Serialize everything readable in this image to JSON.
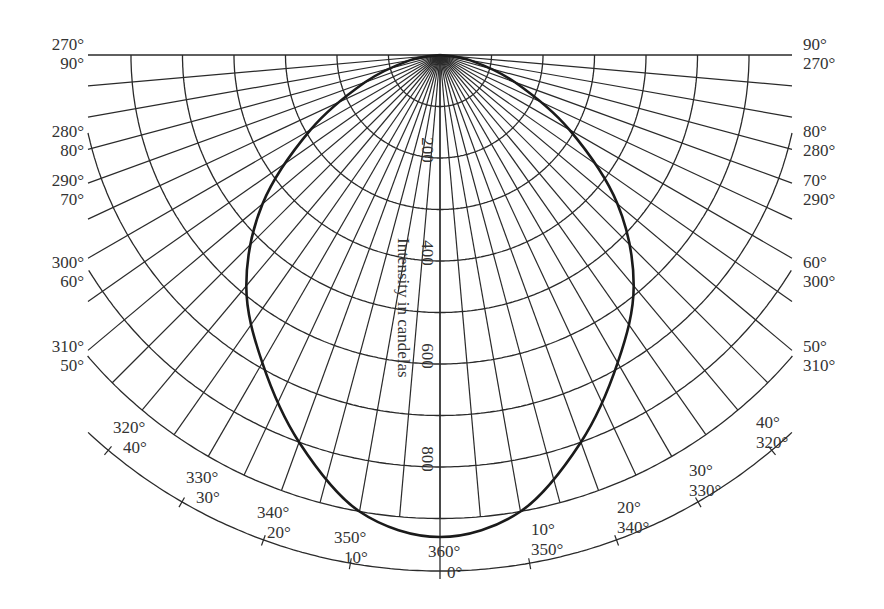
{
  "chart_data": {
    "type": "polar",
    "title": "",
    "radial_axis_label": "Intensity in candelas",
    "radial_ticks": [
      200,
      400,
      600,
      800
    ],
    "radial_grid_step": 100,
    "radial_max": 900,
    "angular_grid_step_deg": 5,
    "left_labels": [
      {
        "outer": "270°",
        "inner": "90°"
      },
      {
        "outer": "280°",
        "inner": "80°"
      },
      {
        "outer": "290°",
        "inner": "70°"
      },
      {
        "outer": "300°",
        "inner": "60°"
      },
      {
        "outer": "310°",
        "inner": "50°"
      },
      {
        "outer": "320°",
        "inner": "40°"
      },
      {
        "outer": "330°",
        "inner": "30°"
      },
      {
        "outer": "340°",
        "inner": "20°"
      },
      {
        "outer": "350°",
        "inner": "10°"
      }
    ],
    "right_labels": [
      {
        "outer": "90°",
        "inner": "270°"
      },
      {
        "outer": "80°",
        "inner": "280°"
      },
      {
        "outer": "70°",
        "inner": "290°"
      },
      {
        "outer": "60°",
        "inner": "300°"
      },
      {
        "outer": "50°",
        "inner": "310°"
      },
      {
        "outer": "40°",
        "inner": "320°"
      },
      {
        "outer": "30°",
        "inner": "330°"
      },
      {
        "outer": "20°",
        "inner": "340°"
      },
      {
        "outer": "10°",
        "inner": "350°"
      }
    ],
    "bottom_labels": {
      "outer": "360°",
      "inner": "0°"
    },
    "series": [
      {
        "name": "Luminous intensity distribution",
        "angles_deg": [
          0,
          10,
          20,
          30,
          40,
          50,
          60,
          70,
          80,
          90
        ],
        "values_cd": [
          936,
          900,
          800,
          690,
          585,
          450,
          290,
          155,
          60,
          0
        ],
        "symmetric": true
      }
    ]
  }
}
